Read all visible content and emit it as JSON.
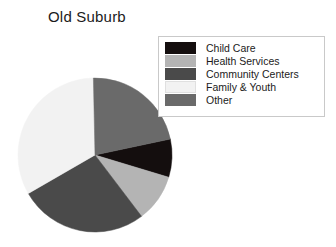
{
  "chart_data": {
    "type": "pie",
    "title": "Old Suburb",
    "xlabel": "",
    "ylabel": "",
    "grid": false,
    "legend_position": "top-right",
    "categories": [
      "Child Care",
      "Health Services",
      "Community Centers",
      "Family & Youth",
      "Other"
    ],
    "values": [
      8,
      10,
      27,
      33,
      22
    ],
    "units": "percent",
    "colors": [
      "#140e0e",
      "#b4b4b4",
      "#4a4a4a",
      "#f2f2f2",
      "#6a6a6a"
    ],
    "slices": [
      {
        "label": "Child Care",
        "value": 8,
        "color": "#140e0e"
      },
      {
        "label": "Health Services",
        "value": 10,
        "color": "#b4b4b4"
      },
      {
        "label": "Community Centers",
        "value": 27,
        "color": "#4a4a4a"
      },
      {
        "label": "Family & Youth",
        "value": 33,
        "color": "#f2f2f2"
      },
      {
        "label": "Other",
        "value": 22,
        "color": "#6a6a6a"
      }
    ],
    "start_angle_deg": -12,
    "direction": "clockwise"
  },
  "legend": {
    "items": [
      {
        "label": "Child Care",
        "color": "#140e0e"
      },
      {
        "label": "Health Services",
        "color": "#b4b4b4"
      },
      {
        "label": "Community Centers",
        "color": "#4a4a4a"
      },
      {
        "label": "Family & Youth",
        "color": "#f2f2f2"
      },
      {
        "label": "Other",
        "color": "#6a6a6a"
      }
    ]
  },
  "pie_geometry": {
    "cx": 95,
    "cy": 155,
    "r": 77
  }
}
